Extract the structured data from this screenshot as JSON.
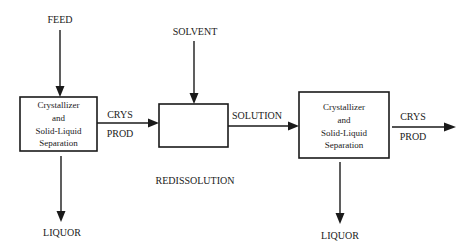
{
  "diagram": {
    "colors": {
      "stroke": "#1a1a1a",
      "background": "#ffffff"
    },
    "nodes": [
      {
        "id": "crystallizer1",
        "lines": [
          "Crystallizer",
          "and",
          "Solid-Liquid",
          "Separation"
        ]
      },
      {
        "id": "redissolution",
        "lines": [],
        "caption": "REDISSOLUTION"
      },
      {
        "id": "crystallizer2",
        "lines": [
          "Crystallizer",
          "and",
          "Solid-Liquid",
          "Separation"
        ]
      }
    ],
    "streams": {
      "feed": "FEED",
      "solvent": "SOLVENT",
      "crys_prod_1": [
        "CRYS",
        "PROD"
      ],
      "solution": "SOLUTION",
      "crys_prod_2": [
        "CRYS",
        "PROD"
      ],
      "liquor_1": "LIQUOR",
      "liquor_2": "LIQUOR"
    },
    "edges": [
      {
        "from": "FEED",
        "to": "crystallizer1"
      },
      {
        "from": "crystallizer1",
        "to": "LIQUOR"
      },
      {
        "from": "crystallizer1",
        "to": "redissolution",
        "label": "CRYS PROD"
      },
      {
        "from": "SOLVENT",
        "to": "redissolution"
      },
      {
        "from": "redissolution",
        "to": "crystallizer2",
        "label": "SOLUTION"
      },
      {
        "from": "crystallizer2",
        "to": "LIQUOR"
      },
      {
        "from": "crystallizer2",
        "to": "output",
        "label": "CRYS PROD"
      }
    ]
  }
}
